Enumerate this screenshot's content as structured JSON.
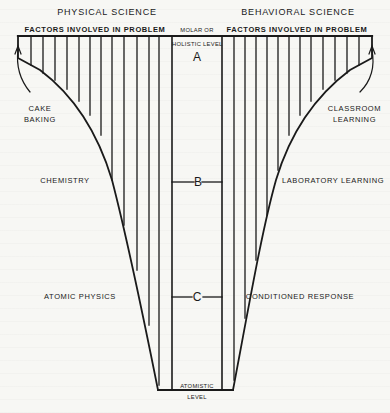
{
  "headings": {
    "left": "PHYSICAL SCIENCE",
    "right": "BEHAVIORAL SCIENCE",
    "left_factors": "FACTORS INVOLVED IN PROBLEM",
    "right_factors": "FACTORS INVOLVED IN PROBLEM",
    "center_top_line1": "MOLAR OR",
    "center_top_line2": "HOLISTIC LEVEL",
    "center_bottom_line1": "ATOMISTIC",
    "center_bottom_line2": "LEVEL"
  },
  "levels": {
    "a": "A",
    "b": "B",
    "c": "C"
  },
  "left_labels": {
    "cake_line1": "CAKE",
    "cake_line2": "BAKING",
    "chemistry": "CHEMISTRY",
    "atomic_physics": "ATOMIC PHYSICS"
  },
  "right_labels": {
    "classroom_line1": "CLASSROOM",
    "classroom_line2": "LEARNING",
    "laboratory": "LABORATORY LEARNING",
    "conditioned": "CONDITIONED RESPONSE"
  },
  "colors": {
    "ink": "#1a1a1a",
    "paper": "#f7f7f4"
  }
}
